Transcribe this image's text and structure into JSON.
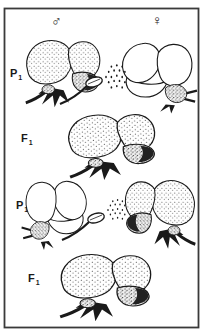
{
  "figure": {
    "symbols": {
      "male": "♂",
      "female": "♀"
    },
    "labels": {
      "p1_top": {
        "main": "P",
        "sub": "1"
      },
      "f1_top": {
        "main": "F",
        "sub": "1"
      },
      "p1_bottom": {
        "main": "P",
        "sub": "1"
      },
      "f1_bottom": {
        "main": "F",
        "sub": "1"
      }
    },
    "colors": {
      "ink": "#1a1a1a",
      "paper": "#ffffff",
      "frame": "#3a3a3a"
    }
  }
}
